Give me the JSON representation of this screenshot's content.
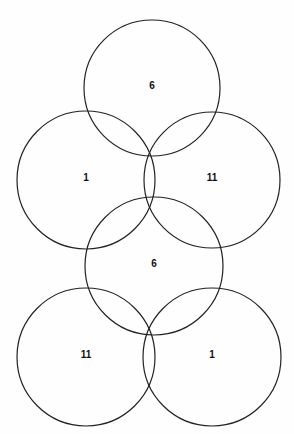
{
  "diagram": {
    "type": "overlapping-circles",
    "stroke_color": "#222222",
    "background": "#fefefe",
    "circles": [
      {
        "id": "top",
        "label": "6",
        "cx": 152,
        "cy": 88,
        "r": 68
      },
      {
        "id": "upper-left",
        "label": "1",
        "cx": 86,
        "cy": 180,
        "r": 69
      },
      {
        "id": "upper-right",
        "label": "11",
        "cx": 212,
        "cy": 180,
        "r": 68
      },
      {
        "id": "middle",
        "label": "6",
        "cx": 154,
        "cy": 266,
        "r": 69
      },
      {
        "id": "lower-left",
        "label": "11",
        "cx": 86,
        "cy": 357,
        "r": 69
      },
      {
        "id": "lower-right",
        "label": "1",
        "cx": 212,
        "cy": 357,
        "r": 69
      }
    ]
  }
}
